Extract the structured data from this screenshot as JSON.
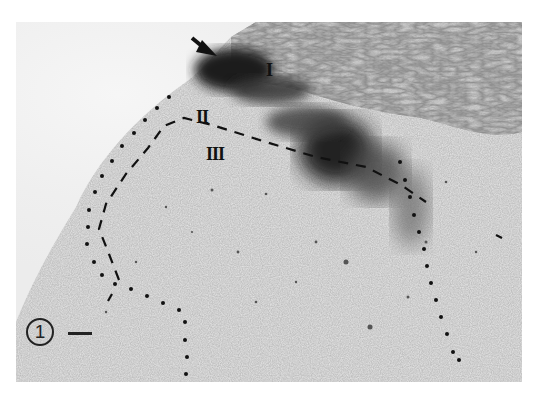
{
  "figure": {
    "figure_number": "1",
    "scale_bar": "scale-bar",
    "layer_labels": [
      {
        "label": "I",
        "x": 266,
        "y": 62
      },
      {
        "label": "II",
        "x": 197,
        "y": 105
      },
      {
        "label": "III",
        "x": 207,
        "y": 142
      }
    ],
    "arrow": {
      "direction": "down-right",
      "tip": [
        202,
        56
      ]
    },
    "colors": {
      "background": "#ffffff",
      "tissue_light": "#e6e6e6",
      "stain_dark": "#1c1c1c",
      "annotation": "#111111"
    }
  }
}
